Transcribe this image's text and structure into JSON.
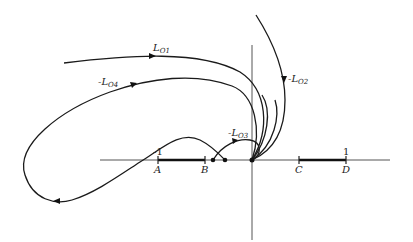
{
  "diagram": {
    "type": "root-locus-sketch",
    "curves": [
      {
        "id": "L01",
        "label_prefix": "L",
        "label_sub": "O1"
      },
      {
        "id": "L02",
        "label_prefix": "-L",
        "label_sub": "O2"
      },
      {
        "id": "L03",
        "label_prefix": "-L",
        "label_sub": "O3"
      },
      {
        "id": "L04",
        "label_prefix": "-L",
        "label_sub": "O4"
      }
    ],
    "axis_points": [
      {
        "id": "A",
        "label": "A",
        "value_label": "-1"
      },
      {
        "id": "B",
        "label": "B"
      },
      {
        "id": "C",
        "label": "C"
      },
      {
        "id": "D",
        "label": "D",
        "value_label": "1"
      }
    ],
    "segments": [
      {
        "from": "A",
        "to": "B"
      },
      {
        "from": "C",
        "to": "D"
      }
    ],
    "colors": {
      "ink": "#1a1a1a",
      "axis": "#555555",
      "background": "#ffffff"
    }
  }
}
